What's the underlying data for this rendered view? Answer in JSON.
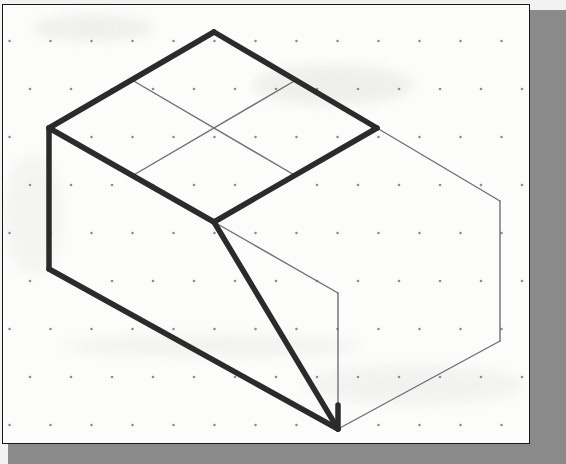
{
  "document": {
    "title": "Isometric Sketch",
    "type": "technical-drawing",
    "medium": "isometric dot grid paper",
    "paper_color": "#fcfcfb",
    "page_background": "#f3f2f0",
    "shadow_color": "#8a8a8a",
    "border_color": "#17181a"
  },
  "sheet": {
    "x": 2,
    "y": 4,
    "width": 528,
    "height": 440,
    "border_width_px": 1.5
  },
  "dot_grid": {
    "label": "isometric-dot-grid",
    "dot_color": "#8e8e90",
    "dot_radius_px": 1.3,
    "column_spacing_px": 41,
    "row_spacing_px": 48,
    "stagger_px": 20.5,
    "columns": 14,
    "rows": 10
  },
  "figure": {
    "name": "isometric-solid",
    "heavy_line_color": "#2b2b2b",
    "heavy_line_width_px": 5.5,
    "thin_line_color": "#6f7074",
    "thin_line_width_px": 1.4,
    "vertices": {
      "top_apex": [
        213,
        31
      ],
      "top_left": [
        48,
        127
      ],
      "top_center": [
        213,
        127
      ],
      "top_right": [
        376,
        127
      ],
      "mid_left": [
        48,
        268
      ],
      "mid_center": [
        213,
        221
      ],
      "mid_right_far": [
        499,
        200
      ],
      "right_lower_far": [
        499,
        340
      ],
      "notch_top": [
        337,
        292
      ],
      "bottom_vertex": [
        337,
        428
      ]
    },
    "heavy_edges": [
      {
        "name": "top-back-left-edge",
        "from": [
          48,
          127
        ],
        "to": [
          213,
          31
        ]
      },
      {
        "name": "top-back-right-edge",
        "from": [
          213,
          31
        ],
        "to": [
          376,
          127
        ]
      },
      {
        "name": "top-front-left-edge",
        "from": [
          48,
          127
        ],
        "to": [
          213,
          221
        ]
      },
      {
        "name": "top-front-right-edge",
        "from": [
          213,
          221
        ],
        "to": [
          376,
          127
        ]
      },
      {
        "name": "left-vertical-edge",
        "from": [
          48,
          127
        ],
        "to": [
          48,
          268
        ]
      },
      {
        "name": "bottom-left-slope-edge",
        "from": [
          48,
          268
        ],
        "to": [
          337,
          428
        ]
      },
      {
        "name": "incline-face-left-edge",
        "from": [
          213,
          221
        ],
        "to": [
          337,
          428
        ]
      },
      {
        "name": "bottom-front-vertical-edge",
        "from": [
          337,
          404
        ],
        "to": [
          337,
          428
        ]
      }
    ],
    "thin_edges": [
      {
        "name": "top-face-grid-line-a",
        "from": [
          131,
          79
        ],
        "to": [
          295,
          175
        ]
      },
      {
        "name": "top-face-grid-line-b",
        "from": [
          131,
          175
        ],
        "to": [
          295,
          79
        ]
      },
      {
        "name": "right-face-top-back-edge",
        "from": [
          376,
          127
        ],
        "to": [
          499,
          200
        ]
      },
      {
        "name": "right-face-top-front-edge",
        "from": [
          213,
          221
        ],
        "to": [
          337,
          292
        ]
      },
      {
        "name": "right-face-far-vertical-edge",
        "from": [
          499,
          200
        ],
        "to": [
          499,
          340
        ]
      },
      {
        "name": "right-face-near-vertical-edge",
        "from": [
          376,
          127
        ],
        "to": [
          376,
          127
        ]
      },
      {
        "name": "right-face-bottom-edge",
        "from": [
          337,
          428
        ],
        "to": [
          499,
          340
        ]
      },
      {
        "name": "notch-vertical-edge",
        "from": [
          337,
          292
        ],
        "to": [
          337,
          428
        ]
      }
    ]
  }
}
